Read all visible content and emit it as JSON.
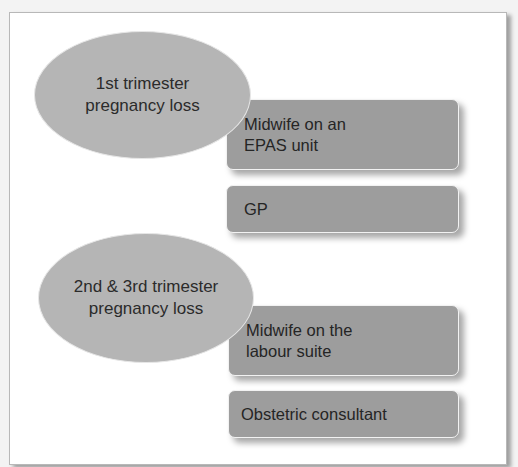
{
  "diagram": {
    "groups": [
      {
        "category": {
          "line1": "1st trimester",
          "line2": "pregnancy loss"
        },
        "providers": [
          {
            "line1": "Midwife on an",
            "line2": "EPAS unit"
          },
          {
            "line1": "GP",
            "line2": ""
          }
        ]
      },
      {
        "category": {
          "line1": "2nd & 3rd trimester",
          "line2": "pregnancy loss"
        },
        "providers": [
          {
            "line1": "Midwife on the",
            "line2": "labour suite"
          },
          {
            "line1": "Obstetric consultant",
            "line2": ""
          }
        ]
      }
    ],
    "colors": {
      "ellipse_fill": "#b5b5b5",
      "box_fill": "#9d9d9d",
      "frame_bg": "#ffffff",
      "text": "#252525"
    }
  }
}
